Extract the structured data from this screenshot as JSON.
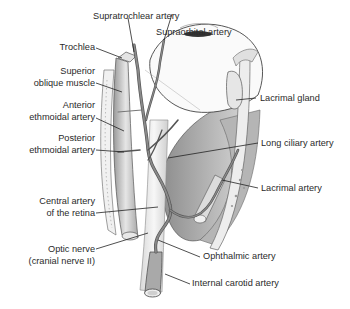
{
  "figure": {
    "labels": {
      "supratrochlear_artery": "Supratrochlear artery",
      "supraorbital_artery": "Supraorbital artery",
      "trochlea": "Trochlea",
      "superior_oblique_1": "Superior",
      "superior_oblique_2": "oblique muscle",
      "anterior_ethmoidal_1": "Anterior",
      "anterior_ethmoidal_2": "ethmoidal artery",
      "posterior_ethmoidal_1": "Posterior",
      "posterior_ethmoidal_2": "ethmoidal artery",
      "lacrimal_gland": "Lacrimal gland",
      "long_ciliary_artery": "Long ciliary artery",
      "lacrimal_artery": "Lacrimal artery",
      "central_artery_1": "Central artery",
      "central_artery_2": "of the retina",
      "optic_nerve_1": "Optic nerve",
      "optic_nerve_2": "(cranial nerve II)",
      "ophthalmic_artery": "Ophthalmic artery",
      "internal_carotid_artery": "Internal carotid artery"
    }
  }
}
